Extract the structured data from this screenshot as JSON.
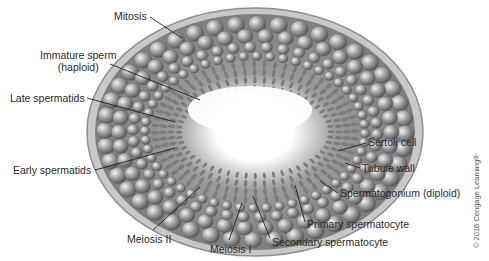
{
  "diagram": {
    "colors": {
      "background": "#ffffff",
      "tubule_wall": "#a9a9a9",
      "cells_dark": "#6e6e6e",
      "cells_light": "#d8d8d8",
      "lumen": "#ffffff",
      "label_text": "#2b2b2b",
      "leader_line": "#222222"
    },
    "labels": [
      {
        "id": "mitosis",
        "text": "Mitosis",
        "x": 114,
        "y": 10,
        "line": [
          150,
          17,
          182,
          38
        ]
      },
      {
        "id": "immature-sperm",
        "text": "Immature sperm",
        "text2": "(haploid)",
        "x": 40,
        "y": 49,
        "line": [
          110,
          64,
          200,
          100
        ]
      },
      {
        "id": "late-spermatids",
        "text": "Late spermatids",
        "x": 10,
        "y": 92,
        "line": [
          87,
          98,
          175,
          122
        ]
      },
      {
        "id": "early-spermatids",
        "text": "Early spermatids",
        "x": 13,
        "y": 164,
        "line": [
          95,
          170,
          175,
          148
        ]
      },
      {
        "id": "meiosis-ii",
        "text": "Meiosis II",
        "x": 127,
        "y": 233,
        "line": [
          153,
          230,
          200,
          187
        ]
      },
      {
        "id": "meiosis-i",
        "text": "Meiosis I",
        "x": 210,
        "y": 243,
        "line": [
          229,
          240,
          242,
          203
        ]
      },
      {
        "id": "sertoli-cell",
        "text": "Sertoli cell",
        "x": 368,
        "y": 136,
        "line": [
          366,
          143,
          338,
          151
        ]
      },
      {
        "id": "tubule-wall",
        "text": "Tubule wall",
        "x": 362,
        "y": 162,
        "line": [
          360,
          168,
          345,
          163
        ]
      },
      {
        "id": "spermatogonium",
        "text": "Spermatogonium (diploid)",
        "x": 340,
        "y": 187,
        "line": [
          338,
          193,
          320,
          181
        ]
      },
      {
        "id": "primary-spermatocyte",
        "text": "Primary spermatocyte",
        "x": 307,
        "y": 218,
        "line": [
          305,
          222,
          295,
          185
        ]
      },
      {
        "id": "secondary-spermatocyte",
        "text": "Secondary spermatocyte",
        "x": 272,
        "y": 236,
        "line": [
          270,
          238,
          253,
          196
        ]
      }
    ],
    "copyright": "© 2016 Cengage Learning®"
  }
}
